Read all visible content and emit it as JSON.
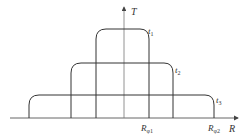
{
  "diagram": {
    "type": "temperature-radius profile",
    "colors": {
      "line": "#333333",
      "axis": "#555555",
      "background": "#ffffff"
    },
    "axes": {
      "vertical": {
        "label": "T"
      },
      "horizontal": {
        "label": "R"
      }
    },
    "curves": [
      {
        "label": "t",
        "sub": "1"
      },
      {
        "label": "t",
        "sub": "2"
      },
      {
        "label": "t",
        "sub": "3"
      }
    ],
    "markers": [
      {
        "label": "R",
        "sub": "φ1"
      },
      {
        "label": "R",
        "sub": "φ2"
      }
    ]
  }
}
